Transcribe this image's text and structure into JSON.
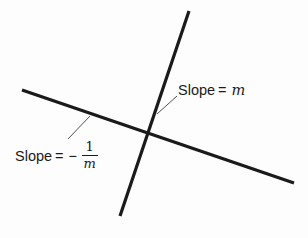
{
  "figure": {
    "background_color": "#fdfdfd",
    "ink_color": "#1a1a1a",
    "width": 308,
    "height": 238
  },
  "diagram": {
    "lines": [
      {
        "name": "steep-line",
        "description": "steep positive-slope line",
        "x1": 189,
        "y1": 11,
        "x2": 120,
        "y2": 216,
        "stroke_width": 3.2,
        "color": "#1a1a1a"
      },
      {
        "name": "shallow-line",
        "description": "shallow negative-slope line",
        "x1": 22,
        "y1": 90,
        "x2": 294,
        "y2": 183,
        "stroke_width": 3.2,
        "color": "#1a1a1a"
      }
    ],
    "intersection": {
      "x": 146,
      "y": 136
    },
    "leaders": [
      {
        "name": "leader-slope-m",
        "x1": 177,
        "y1": 96,
        "x2": 157,
        "y2": 114,
        "stroke_width": 0.9,
        "color": "#3d3d3d"
      },
      {
        "name": "leader-slope-negative-reciprocal",
        "x1": 68,
        "y1": 139,
        "x2": 90,
        "y2": 116,
        "stroke_width": 0.9,
        "color": "#3d3d3d"
      }
    ]
  },
  "labels": {
    "slope_m": {
      "prefix": "Slope",
      "equals": "=",
      "variable": "m",
      "full_text": "Slope = m"
    },
    "slope_negative_reciprocal": {
      "prefix": "Slope",
      "equals": "=",
      "minus": "−",
      "numerator": "1",
      "denominator": "m",
      "full_text": "Slope = − 1/m"
    }
  }
}
